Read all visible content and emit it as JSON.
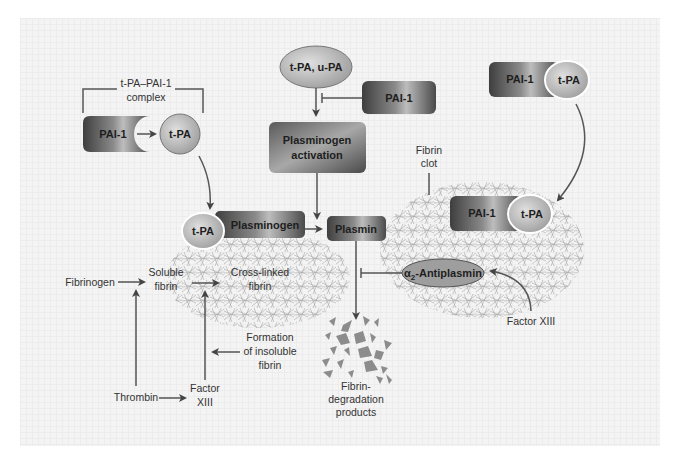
{
  "diagram": {
    "colors": {
      "panel_bg": "#f4f4f4",
      "box_dark": "#4a4a4a",
      "box_light": "#b8b8b8",
      "oval_fill": "#c4c4c4",
      "fibrin_mesh": "#9a9a9a",
      "fragments": "#8c8c8c",
      "line": "#555555",
      "text": "#333333"
    },
    "complex_bracket": {
      "line1": "t-PA–PAI-1",
      "line2": "complex"
    },
    "left_pai1": {
      "label": "PAI-1"
    },
    "left_tpa": {
      "label": "t-PA"
    },
    "activator_oval": {
      "label": "t-PA, u-PA"
    },
    "inhibitor_pai1": {
      "label": "PAI-1"
    },
    "plasminogen_activation": {
      "line1": "Plasminogen",
      "line2": "activation"
    },
    "top_right_complex": {
      "pai1": "PAI-1",
      "tpa": "t-PA"
    },
    "fibrin_clot_label": {
      "line1": "Fibrin",
      "line2": "clot"
    },
    "bound_complex": {
      "tpa": "t-PA",
      "plasminogen": "Plasminogen"
    },
    "plasmin": {
      "label": "Plasmin"
    },
    "clot_complex": {
      "pai1": "PAI-1",
      "tpa": "t-PA"
    },
    "antiplasmin": {
      "alpha": "α",
      "sub": "2",
      "rest": "-Antiplasmin"
    },
    "fibrinogen": {
      "label": "Fibrinogen"
    },
    "soluble_fibrin": {
      "line1": "Soluble",
      "line2": "fibrin"
    },
    "cross_linked_fibrin": {
      "line1": "Cross-linked",
      "line2": "fibrin"
    },
    "formation_insoluble": {
      "line1": "Formation",
      "line2": "of insoluble",
      "line3": "fibrin"
    },
    "thrombin": {
      "label": "Thrombin"
    },
    "factor_xiii_left": {
      "line1": "Factor",
      "line2": "XIII"
    },
    "factor_xiii_right": {
      "label": "Factor XIII"
    },
    "fdp": {
      "line1": "Fibrin-",
      "line2": "degradation",
      "line3": "products"
    }
  }
}
